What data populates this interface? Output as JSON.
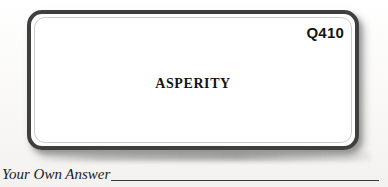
{
  "card": {
    "question_number": "Q410",
    "word": "ASPERITY"
  },
  "answer": {
    "label": "Your Own Answer",
    "value": ""
  },
  "colors": {
    "page_background": "#ffffff",
    "card_border": "#3f3f3f",
    "card_background": "#ffffff",
    "text": "#141414",
    "rule": "#3a3a3a"
  }
}
